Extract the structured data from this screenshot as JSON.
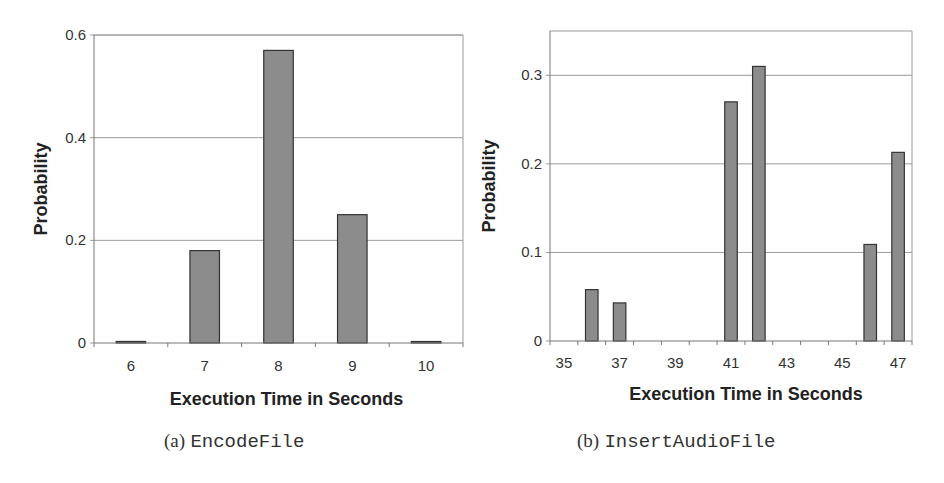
{
  "chart_data": [
    {
      "type": "bar",
      "title": "",
      "caption_letter": "(a)",
      "caption_name": "EncodeFile",
      "xlabel": "Execution Time in Seconds",
      "ylabel": "Probability",
      "categories": [
        "6",
        "7",
        "8",
        "9",
        "10"
      ],
      "x_tick_labels": [
        "6",
        "7",
        "8",
        "9",
        "10"
      ],
      "values": [
        0.003,
        0.18,
        0.57,
        0.25,
        0.001
      ],
      "ylim": [
        0,
        0.6
      ],
      "y_ticks": [
        0,
        0.2,
        0.4,
        0.6
      ],
      "y_tick_labels": [
        "0",
        "0.2",
        "0.4",
        "0.6"
      ],
      "grid": true,
      "legend": null,
      "bar_color": "#8c8c8c"
    },
    {
      "type": "bar",
      "title": "",
      "caption_letter": "(b)",
      "caption_name": "InsertAudioFile",
      "xlabel": "Execution Time in Seconds",
      "ylabel": "Probability",
      "categories": [
        "35",
        "36",
        "37",
        "38",
        "39",
        "40",
        "41",
        "42",
        "43",
        "44",
        "45",
        "46",
        "47"
      ],
      "x_tick_labels": [
        "35",
        "37",
        "39",
        "41",
        "43",
        "45",
        "47"
      ],
      "values": [
        0,
        0.058,
        0.043,
        0,
        0,
        0,
        0.27,
        0.31,
        0,
        0,
        0,
        0.109,
        0.213
      ],
      "ylim": [
        0,
        0.35
      ],
      "y_ticks": [
        0,
        0.1,
        0.2,
        0.3
      ],
      "y_tick_labels": [
        "0",
        "0.1",
        "0.2",
        "0.3"
      ],
      "grid": true,
      "legend": null,
      "bar_color": "#8c8c8c"
    }
  ],
  "captions": {
    "a_letter": "(a)",
    "a_name": "EncodeFile",
    "b_letter": "(b)",
    "b_name": "InsertAudioFile"
  },
  "axis_titles": {
    "a_x": "Execution Time in Seconds",
    "a_y": "Probability",
    "b_x": "Execution Time in Seconds",
    "b_y": "Probability"
  },
  "colors": {
    "bar_fill": "#8c8c8c",
    "bar_stroke": "#333333",
    "grid": "#9a9a9a",
    "frame": "#9a9a9a"
  }
}
